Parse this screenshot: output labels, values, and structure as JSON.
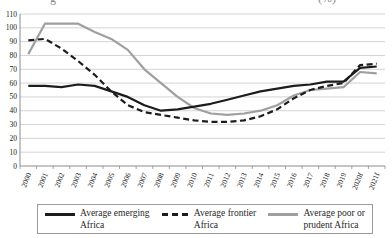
{
  "cropped_title": {
    "left_fragment": "g",
    "right_fragment": "(%)"
  },
  "chart_data": {
    "type": "line",
    "x": [
      "2000",
      "2001",
      "2002",
      "2003",
      "2004",
      "2005",
      "2006",
      "2007",
      "2008",
      "2009",
      "2010",
      "2011",
      "2012",
      "2013",
      "2014",
      "2015",
      "2016",
      "2017",
      "2018",
      "2019",
      "2020f",
      "2021f"
    ],
    "series": [
      {
        "name": "Average emerging Africa",
        "style": "solid-black",
        "z": 1,
        "values": [
          58,
          58,
          57,
          59,
          58,
          54,
          50,
          44,
          40,
          41,
          43,
          45,
          48,
          51,
          54,
          56,
          58,
          59,
          61,
          61,
          71,
          72
        ]
      },
      {
        "name": "Average frontier Africa",
        "style": "dashed-black",
        "z": 2,
        "values": [
          91,
          92,
          85,
          76,
          66,
          54,
          44,
          39,
          37,
          35,
          33,
          32,
          32,
          33,
          36,
          41,
          49,
          55,
          58,
          60,
          73,
          74
        ]
      },
      {
        "name": "Average poor or prudent Africa",
        "style": "solid-gray",
        "z": 0,
        "values": [
          81,
          103,
          103,
          103,
          97,
          92,
          84,
          70,
          60,
          50,
          42,
          38,
          37,
          38,
          40,
          44,
          51,
          55,
          56,
          57,
          68,
          67
        ]
      }
    ],
    "title": "",
    "xlabel": "",
    "ylabel": "",
    "ylim": [
      0,
      110
    ],
    "ytick_step": 10,
    "grid": true,
    "legend_position": "bottom",
    "colors": {
      "black": "#1c1c1c",
      "gray": "#9f9f9f",
      "grid": "#c9c9c9",
      "axis": "#8c8c8c",
      "text": "#222222"
    }
  },
  "legend": {
    "items": [
      {
        "line1": "Average emerging",
        "line2": "Africa",
        "swatch": "solid-black"
      },
      {
        "line1": "Average frontier",
        "line2": "Africa",
        "swatch": "dashed-black"
      },
      {
        "line1": "Average poor or",
        "line2": "prudent Africa",
        "swatch": "solid-gray"
      }
    ]
  }
}
